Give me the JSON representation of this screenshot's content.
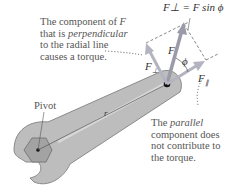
{
  "annotations": {
    "perpendicular": {
      "line1_prefix": "The component of ",
      "line1_symbol": "F",
      "line2_prefix": "that is ",
      "line2_emph": "perpendicular",
      "line3": "to the radial line",
      "line4": "causes a torque."
    },
    "parallel": {
      "line1_prefix": "The ",
      "line1_emph": "parallel",
      "line2": "component does",
      "line3": "not contribute to",
      "line4": "the torque."
    },
    "pivot": "Pivot",
    "equation": "F⊥ = F sin ϕ"
  },
  "symbols": {
    "force": "F",
    "perp_sub": "⊥",
    "par_sub": "∥",
    "angle": "ϕ",
    "radius": "r"
  },
  "colors": {
    "wrench": "#b8b8b8",
    "wrench_edge": "#8a8a8a",
    "nut": "#9a9a9a",
    "vector": "#9a9aa8",
    "text": "#555555"
  }
}
